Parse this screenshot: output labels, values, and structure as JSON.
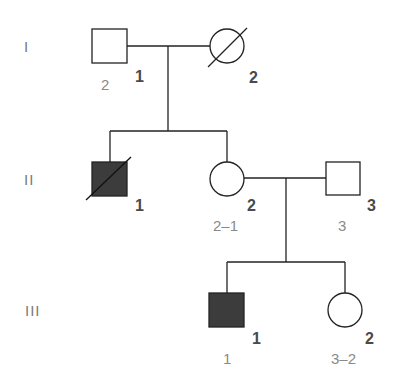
{
  "diagram": {
    "type": "pedigree",
    "colors": {
      "line": "#222222",
      "affected_fill": "#3c3c3c",
      "unaffected_fill": "#ffffff"
    },
    "generations": [
      {
        "label": "I"
      },
      {
        "label": "II"
      },
      {
        "label": "III"
      }
    ],
    "individuals": {
      "I_1": {
        "sex": "male",
        "affected": false,
        "deceased": false,
        "index": "1",
        "sublabel": "2"
      },
      "I_2": {
        "sex": "female",
        "affected": false,
        "deceased": true,
        "index": "2",
        "sublabel": ""
      },
      "II_1": {
        "sex": "male",
        "affected": true,
        "deceased": true,
        "index": "1",
        "sublabel": ""
      },
      "II_2": {
        "sex": "female",
        "affected": false,
        "deceased": false,
        "index": "2",
        "sublabel": "2–1"
      },
      "II_3": {
        "sex": "male",
        "affected": false,
        "deceased": false,
        "index": "3",
        "sublabel": "3"
      },
      "III_1": {
        "sex": "male",
        "affected": true,
        "deceased": false,
        "index": "1",
        "sublabel": "1"
      },
      "III_2": {
        "sex": "female",
        "affected": false,
        "deceased": false,
        "index": "2",
        "sublabel": "3–2"
      }
    },
    "matings": [
      {
        "partners": [
          "I_1",
          "I_2"
        ],
        "children": [
          "II_1",
          "II_2"
        ]
      },
      {
        "partners": [
          "II_2",
          "II_3"
        ],
        "children": [
          "III_1",
          "III_2"
        ]
      }
    ]
  }
}
